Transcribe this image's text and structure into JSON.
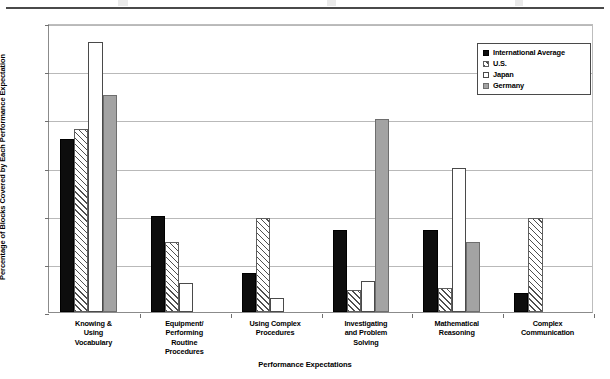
{
  "chart_data": {
    "type": "bar",
    "title": "",
    "xlabel": "Performance Expectations",
    "ylabel": "Percentage of Blocks Covered by Each Performance Expectation",
    "ylim": [
      0,
      60
    ],
    "yticks": [
      0,
      10,
      20,
      30,
      40,
      50,
      60
    ],
    "ytick_labels": [
      "0%",
      "10%",
      "20%",
      "30%",
      "40%",
      "50%",
      "60%"
    ],
    "grid": true,
    "legend_position": "top-right",
    "categories": [
      "Knowing & Using Vocabulary",
      "Equipment/ Performing Routine Procedures",
      "Using Complex Procedures",
      "Investigating and Problem Solving",
      "Mathematical Reasoning",
      "Complex Communication"
    ],
    "category_lines": [
      [
        "Knowing &",
        "Using",
        "Vocabulary"
      ],
      [
        "Equipment/",
        "Performing",
        "Routine",
        "Procedures"
      ],
      [
        "Using Complex",
        "Procedures"
      ],
      [
        "Investigating",
        "and Problem",
        "Solving"
      ],
      [
        "Mathematical",
        "Reasoning"
      ],
      [
        "Complex",
        "Communication"
      ]
    ],
    "series": [
      {
        "name": "International Average",
        "fill": "solid-black",
        "color": "#0d0d0d",
        "values": [
          36,
          20,
          8,
          17,
          17,
          4
        ]
      },
      {
        "name": "U.S.",
        "fill": "diagonal-hatch",
        "color": "#ffffff",
        "values": [
          38,
          14.5,
          19.5,
          4.5,
          5,
          19.5
        ]
      },
      {
        "name": "Japan",
        "fill": "empty-white",
        "color": "#ffffff",
        "values": [
          56,
          6,
          3,
          6.5,
          30,
          0
        ]
      },
      {
        "name": "Germany",
        "fill": "solid-gray",
        "color": "#a3a3a3",
        "values": [
          45,
          0,
          0,
          40,
          14.5,
          0
        ]
      }
    ]
  }
}
